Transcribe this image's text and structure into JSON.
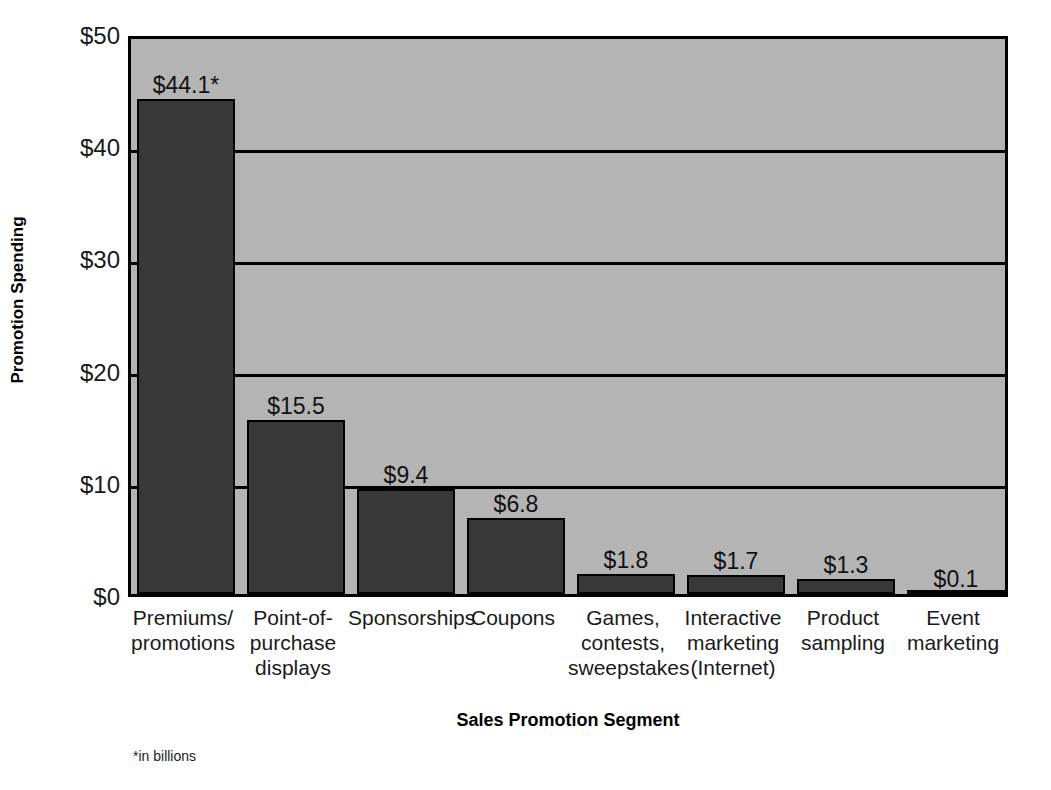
{
  "chart_data": {
    "type": "bar",
    "title": "",
    "xlabel": "Sales Promotion Segment",
    "ylabel": "Promotion Spending",
    "footnote": "*in billions",
    "ylim": [
      0,
      50
    ],
    "yticks": [
      0,
      10,
      20,
      30,
      40,
      50
    ],
    "ytick_labels": [
      "$0",
      "$10",
      "$20",
      "$30",
      "$40",
      "$50"
    ],
    "grid": true,
    "legend": "none",
    "categories": [
      "Premiums/ promotions",
      "Point-of- purchase displays",
      "Sponsorships",
      "Coupons",
      "Games, contests, sweepstakes",
      "Interactive marketing (Internet)",
      "Product sampling",
      "Event marketing"
    ],
    "category_lines": [
      [
        "Premiums/",
        "promotions"
      ],
      [
        "Point-of-",
        "purchase",
        "displays"
      ],
      [
        "Sponsorships"
      ],
      [
        "Coupons"
      ],
      [
        "Games,",
        "contests,",
        "sweepstakes"
      ],
      [
        "Interactive",
        "marketing",
        "(Internet)"
      ],
      [
        "Product",
        "sampling"
      ],
      [
        "Event",
        "marketing"
      ]
    ],
    "values": [
      44.1,
      15.5,
      9.4,
      6.8,
      1.8,
      1.7,
      1.3,
      0.1
    ],
    "value_labels": [
      "$44.1*",
      "$15.5",
      "$9.4",
      "$6.8",
      "$1.8",
      "$1.7",
      "$1.3",
      "$0.1"
    ],
    "colors": {
      "bar_fill": "#383838",
      "bar_edge": "#000000",
      "plot_background": "#b4b4b4",
      "axis_line": "#000000",
      "text": "#111111",
      "page_background": "#ffffff"
    }
  }
}
